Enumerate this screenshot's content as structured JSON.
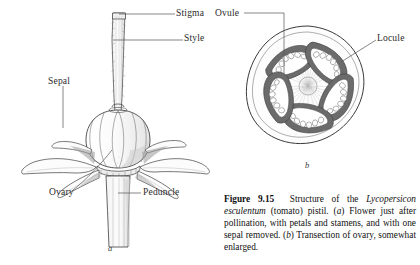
{
  "figure": {
    "number": "Figure 9.15",
    "panel_a_letter": "a",
    "panel_b_letter": "b",
    "caption_parts": {
      "label": "Figure 9.15",
      "text_1": "Structure of the ",
      "species": "Lycopersicon esculentum",
      "text_2": " (tomato) pistil. (",
      "a": "a",
      "text_3": ") Flower just after pollination, with petals and stamens, and with one sepal removed. (",
      "b": "b",
      "text_4": ") Transection of ovary, somewhat enlarged."
    },
    "caption_full": "Figure 9.15  Structure of the Lycopersicon esculentum (tomato) pistil. (a) Flower just after pollination, with petals and stamens, and with one sepal removed. (b) Transection of ovary, somewhat enlarged."
  },
  "panel_a": {
    "name": "tomato-flower-longitudinal-view",
    "labels": [
      {
        "key": "stigma",
        "text": "Stigma"
      },
      {
        "key": "style",
        "text": "Style"
      },
      {
        "key": "sepal",
        "text": "Sepal"
      },
      {
        "key": "ovary",
        "text": "Ovary"
      },
      {
        "key": "peduncle",
        "text": "Peduncle"
      }
    ]
  },
  "panel_b": {
    "name": "ovary-transection",
    "labels": [
      {
        "key": "ovule",
        "text": "Ovule"
      },
      {
        "key": "locule",
        "text": "Locule"
      }
    ],
    "locule_count": 5
  },
  "colors": {
    "ink": "#2b2b2b",
    "leader": "#555555",
    "paper": "#ffffff",
    "shade": "#8d8d8d",
    "dark_tissue": "#4a4a4a"
  }
}
